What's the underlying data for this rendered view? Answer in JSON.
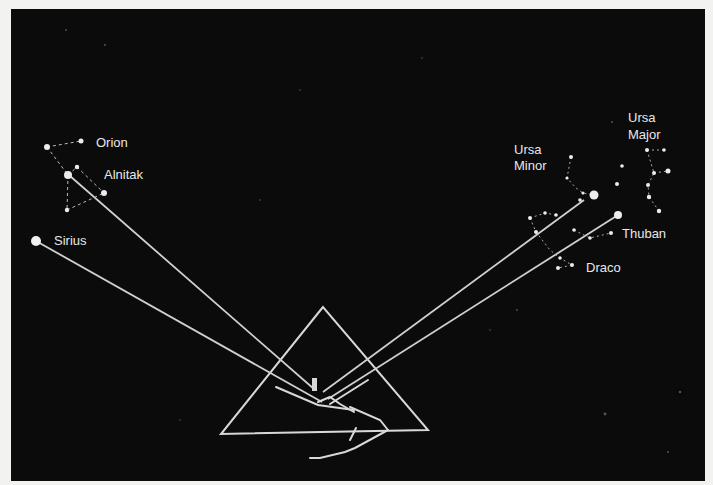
{
  "colors": {
    "page_background": "#f2f2f0",
    "panel": "#0b0b0b",
    "line": "#d8d8d8",
    "star": "#ececec",
    "label": "#e8e8e8"
  },
  "labels": {
    "orion": "Orion",
    "alnitak": "Alnitak",
    "sirius": "Sirius",
    "ursa_minor_line1": "Ursa",
    "ursa_minor_line2": "Minor",
    "ursa_major_line1": "Ursa",
    "ursa_major_line2": "Major",
    "thuban": "Thuban",
    "draco": "Draco"
  },
  "constellations": [
    {
      "name": "Orion",
      "highlight_star": "Alnitak"
    },
    {
      "name": "Canis Major",
      "highlight_star": "Sirius"
    },
    {
      "name": "Ursa Minor",
      "highlight_star": "Kochab"
    },
    {
      "name": "Draco",
      "highlight_star": "Thuban"
    },
    {
      "name": "Ursa Major",
      "highlight_star": null
    }
  ],
  "shafts": [
    {
      "from": "Alnitak",
      "direction": "south"
    },
    {
      "from": "Sirius",
      "direction": "south"
    },
    {
      "from": "Thuban",
      "direction": "north"
    },
    {
      "from": "Ursa Minor",
      "direction": "north"
    }
  ]
}
